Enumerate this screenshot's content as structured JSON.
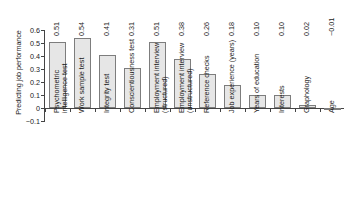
{
  "chart_data": {
    "type": "bar",
    "title": "",
    "xlabel": "",
    "ylabel": "Predicting job performance",
    "ylim": [
      -0.1,
      0.6
    ],
    "ytick_labels": [
      "0.6",
      "0.5",
      "0.4",
      "0.3",
      "0.2",
      "0.1",
      "0",
      "−0.1"
    ],
    "ytick_values": [
      0.6,
      0.5,
      0.4,
      0.3,
      0.2,
      0.1,
      0,
      -0.1
    ],
    "grid": false,
    "legend": "none",
    "categories": [
      "Psychometric intelligence test",
      "Work sample test",
      "Integrity test",
      "Conscientiousness test",
      "Employment interview (structured)",
      "Employment interview (unstructured)",
      "Reference checks",
      "Job experience (years)",
      "Years of education",
      "Interests",
      "Graphology",
      "Age"
    ],
    "category_lines": [
      [
        "Psychometric",
        "intelligence test"
      ],
      [
        "Work sample test",
        ""
      ],
      [
        "Integrity test",
        ""
      ],
      [
        "Conscientiousness test",
        ""
      ],
      [
        "Employment interview",
        "(structured)"
      ],
      [
        "Employment interview",
        "(unstructured)"
      ],
      [
        "Reference checks",
        ""
      ],
      [
        "Job experience (years)",
        ""
      ],
      [
        "Years of education",
        ""
      ],
      [
        "Interests",
        ""
      ],
      [
        "Graphology",
        ""
      ],
      [
        "Age",
        ""
      ]
    ],
    "values": [
      0.51,
      0.54,
      0.41,
      0.31,
      0.51,
      0.38,
      0.26,
      0.18,
      0.1,
      0.1,
      0.02,
      -0.01
    ],
    "value_labels": [
      "0.51",
      "0.54",
      "0.41",
      "0.31",
      "0.51",
      "0.38",
      "0.26",
      "0.18",
      "0.10",
      "0.10",
      "0.02",
      "−0.01"
    ],
    "bar_fill_color": "#e6e6e6",
    "bar_edge_color": "#7d7d7d",
    "axis_color": "#444444",
    "background_color": "#ffffff"
  }
}
